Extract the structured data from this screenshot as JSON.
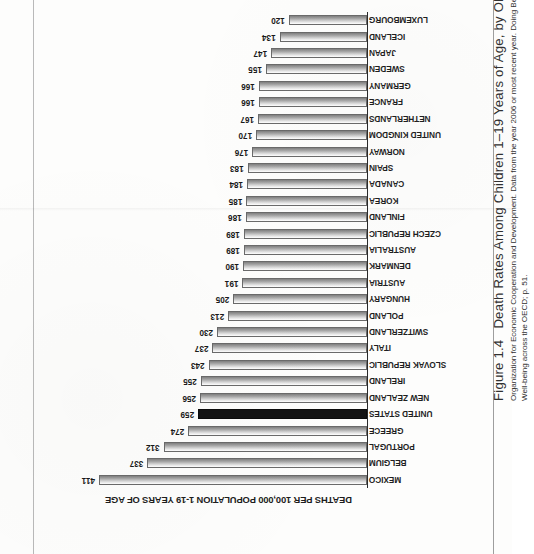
{
  "figure": {
    "number": "Figure 1.4",
    "title": "Death Rates Among Children 1–19 Years of Age, by OECD Country",
    "source_line_1": "Organization for Economic Cooperation and Development. Data from the year 2006 or most recent year. Doing Better for Children. Chapter 2: Comparative Child",
    "source_line_2": "Well-being across the OECD; p. 51."
  },
  "chart_data": {
    "type": "bar",
    "orientation": "horizontal",
    "title": "Death Rates Among Children 1–19 Years of Age, by OECD Country",
    "xlabel": "DEATHS PER 100,000 POPULATION 1-19 YEARS OF AGE",
    "ylabel": "",
    "axis_title": "DEATHS PER 100,000 POPULATION 1-19 YEARS OF AGE",
    "xlim": [
      0,
      411
    ],
    "grid": false,
    "legend": false,
    "highlight_category": "UNITED STATES",
    "highlight_color": "#141414",
    "bar_fill": "#b0b0b0",
    "bar_border": "#6a6a6a",
    "categories": [
      "MEXICO",
      "BELGIUM",
      "PORTUGAL",
      "GREECE",
      "UNITED STATES",
      "NEW ZEALAND",
      "IRELAND",
      "SLOVAK REPUBLIC",
      "ITALY",
      "SWITZERLAND",
      "POLAND",
      "HUNGARY",
      "AUSTRIA",
      "DENMARK",
      "AUSTRALIA",
      "CZECH REPUBLIC",
      "FINLAND",
      "KOREA",
      "CANADA",
      "SPAIN",
      "NORWAY",
      "UNITED KINGDOM",
      "NETHERLANDS",
      "FRANCE",
      "GERMANY",
      "SWEDEN",
      "JAPAN",
      "ICELAND",
      "LUXEMBOURG"
    ],
    "values": [
      411,
      337,
      312,
      274,
      259,
      256,
      255,
      243,
      237,
      230,
      213,
      205,
      191,
      190,
      189,
      189,
      186,
      185,
      184,
      183,
      176,
      170,
      167,
      166,
      166,
      155,
      147,
      134,
      120
    ]
  }
}
